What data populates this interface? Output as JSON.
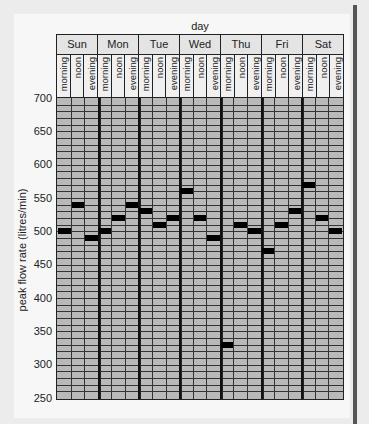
{
  "chart_data": {
    "type": "table",
    "title": "day",
    "xlabel": "day",
    "ylabel": "peak flow rate (litres/min)",
    "ylim": [
      250,
      700
    ],
    "y_ticks": [
      700,
      650,
      600,
      550,
      500,
      450,
      400,
      350,
      300,
      250
    ],
    "grid_step": 10,
    "categories": [
      "Sun",
      "Mon",
      "Tue",
      "Wed",
      "Thu",
      "Fri",
      "Sat"
    ],
    "slots": [
      "morning",
      "noon",
      "evening"
    ],
    "series": [
      {
        "name": "morning",
        "values": [
          500,
          500,
          530,
          560,
          330,
          470,
          570
        ]
      },
      {
        "name": "noon",
        "values": [
          540,
          520,
          510,
          520,
          510,
          510,
          520
        ]
      },
      {
        "name": "evening",
        "values": [
          490,
          540,
          520,
          490,
          500,
          530,
          500
        ]
      }
    ]
  },
  "labels": {
    "title": "day",
    "ylabel": "peak flow rate (litres/min)"
  },
  "colors": {
    "cell": "#b9b9b9",
    "marker": "#000000",
    "header": "#e4e4e4"
  }
}
